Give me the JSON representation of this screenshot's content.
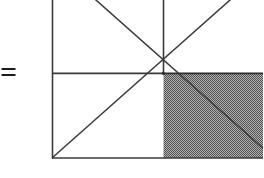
{
  "figure": {
    "label": "square-quadrant-diagram",
    "equals_symbol": "=",
    "caption": "",
    "colors": {
      "stroke": "#3a3a3a",
      "stroke_heavy": "#2b2b2b",
      "shade_fill": "#8a8a8a",
      "shade_dot": "#4a4a4a",
      "background": "#ffffff"
    },
    "geometry": {
      "description": "A square, cropped at the top and right edges of the image, divided into four equal quadrants by a vertical midline and a horizontal midline meeting at the center point. Both full diagonals of the square pass through the center. The lower-right quadrant is filled with a gray stipple pattern and is crossed by the descending diagonal.",
      "square": {
        "left": 52,
        "right": 274,
        "top": -39,
        "bottom": 158
      },
      "center": {
        "x": 163,
        "y": 73
      },
      "lines": [
        {
          "name": "left-edge",
          "x1": 52,
          "y1": -39,
          "x2": 52,
          "y2": 158
        },
        {
          "name": "bottom-edge",
          "x1": 52,
          "y1": 158,
          "x2": 274,
          "y2": 158
        },
        {
          "name": "top-edge",
          "x1": 52,
          "y1": -39,
          "x2": 274,
          "y2": -39
        },
        {
          "name": "right-edge",
          "x1": 274,
          "y1": -39,
          "x2": 274,
          "y2": 158
        },
        {
          "name": "vertical-midline",
          "x1": 163,
          "y1": -39,
          "x2": 163,
          "y2": 73
        },
        {
          "name": "horizontal-midline-left",
          "x1": 52,
          "y1": 73,
          "x2": 163,
          "y2": 73
        },
        {
          "name": "horizontal-midline-right",
          "x1": 163,
          "y1": 73,
          "x2": 274,
          "y2": 73
        },
        {
          "name": "diagonal-tl-to-br",
          "x1": 52,
          "y1": -39,
          "x2": 274,
          "y2": 158
        },
        {
          "name": "diagonal-bl-to-tr",
          "x1": 52,
          "y1": 158,
          "x2": 274,
          "y2": -39
        }
      ],
      "shaded_region": {
        "name": "lower-right-quadrant",
        "x": 163,
        "y": 73,
        "width": 111,
        "height": 85,
        "pattern": "gray-stipple"
      }
    }
  }
}
